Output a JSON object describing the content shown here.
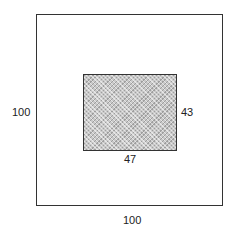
{
  "diagram": {
    "outer_square": {
      "width_label": "100",
      "height_label": "100"
    },
    "inner_rectangle": {
      "width_label": "47",
      "height_label": "43",
      "fill": "hatched gray"
    }
  }
}
